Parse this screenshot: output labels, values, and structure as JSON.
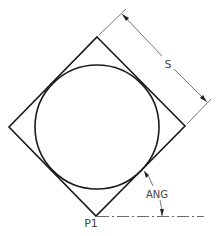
{
  "diagram": {
    "labels": {
      "side": "S",
      "angle": "ANG",
      "point": "P1"
    },
    "geometry": {
      "square_vertices": {
        "top": [
          97,
          37
        ],
        "right": [
          185,
          126
        ],
        "bottom": [
          96,
          216
        ],
        "left": [
          9,
          127
        ]
      },
      "circle": {
        "center": [
          97,
          127
        ],
        "radius": 62
      },
      "dimension_S": {
        "from": [
          122,
          14
        ],
        "to": [
          207,
          102
        ]
      },
      "angle_arc": {
        "start": [
          144,
          171
        ],
        "end": [
          162,
          216
        ]
      },
      "baseline": {
        "from": [
          96,
          216
        ],
        "to": [
          204,
          216
        ],
        "style": "center-line (dash-dot)"
      }
    },
    "colors": {
      "shape_stroke": "#1a1a1a",
      "dimension_stroke": "#555555",
      "text": "#444444",
      "background": "#ffffff"
    }
  }
}
